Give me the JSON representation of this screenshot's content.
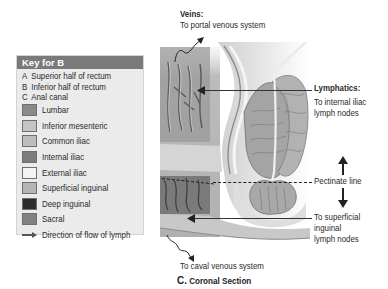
{
  "key": {
    "title": "Key for B",
    "letters": [
      {
        "letter": "A",
        "label": "Superior half of rectum"
      },
      {
        "letter": "B",
        "label": "Inferior half of rectum"
      },
      {
        "letter": "C",
        "label": "Anal canal"
      }
    ],
    "swatches": [
      {
        "label": "Lumbar",
        "color": "#8a8a8a"
      },
      {
        "label": "Inferior mesenteric",
        "color": "#c4c4c4"
      },
      {
        "label": "Common iliac",
        "color": "#bdbdbd"
      },
      {
        "label": "Internal iliac",
        "color": "#7d7d7d"
      },
      {
        "label": "External iliac",
        "color": "#f3f3f3"
      },
      {
        "label": "Superficial inguinal",
        "color": "#b5b5b5"
      },
      {
        "label": "Deep inguinal",
        "color": "#2c2c2c"
      },
      {
        "label": "Sacral",
        "color": "#828282"
      }
    ],
    "flow_label": "Direction of flow of lymph"
  },
  "labels": {
    "veins_title": "Veins:",
    "veins_text": "To portal venous system",
    "lymphatics_title": "Lymphatics:",
    "lymphatics_line1": "To internal iliac",
    "lymphatics_line2": "lymph nodes",
    "pectinate": "Pectinate line",
    "superficial_line1": "To superficial",
    "superficial_line2": "inguinal",
    "superficial_line3": "lymph nodes",
    "caval": "To caval venous system"
  },
  "caption": {
    "letter": "C.",
    "text": "Coronal Section"
  }
}
